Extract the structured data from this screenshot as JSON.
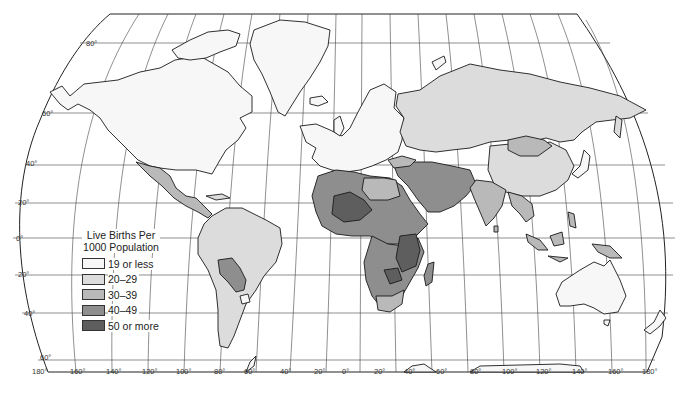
{
  "map": {
    "type": "choropleth",
    "projection": "Robinson-style world map",
    "legend": {
      "title_line1": "Live Births Per",
      "title_line2": "1000 Population",
      "classes": [
        {
          "label": "19 or less",
          "color": "#f7f7f7"
        },
        {
          "label": "20–29",
          "color": "#dcdcdc"
        },
        {
          "label": "30–39",
          "color": "#b9b9b9"
        },
        {
          "label": "40–49",
          "color": "#8e8e8e"
        },
        {
          "label": "50 or more",
          "color": "#5e5e5e"
        }
      ]
    },
    "latitude_labels": [
      "80°",
      "60°",
      "40°",
      "20°",
      "0°",
      "20°",
      "40°",
      "60°"
    ],
    "longitude_labels": [
      "180°",
      "160°",
      "140°",
      "120°",
      "100°",
      "80°",
      "60°",
      "40°",
      "20°",
      "0°",
      "20°",
      "40°",
      "60°",
      "80°",
      "100°",
      "120°",
      "140°",
      "160°",
      "180°"
    ],
    "regions": [
      {
        "name": "North America (USA/Canada)",
        "class": "19 or less"
      },
      {
        "name": "Greenland",
        "class": "19 or less"
      },
      {
        "name": "Mexico & Central America",
        "class": "30–39"
      },
      {
        "name": "South America (Brazil, Argentina etc.)",
        "class": "20–29"
      },
      {
        "name": "Bolivia / Paraguay",
        "class": "30–39"
      },
      {
        "name": "Uruguay",
        "class": "19 or less"
      },
      {
        "name": "Europe",
        "class": "19 or less"
      },
      {
        "name": "USSR",
        "class": "20–29"
      },
      {
        "name": "China",
        "class": "20–29"
      },
      {
        "name": "Mongolia",
        "class": "30–39"
      },
      {
        "name": "North Africa",
        "class": "40–49"
      },
      {
        "name": "Sahel / West Africa",
        "class": "50 or more"
      },
      {
        "name": "Central & East Africa",
        "class": "40–49"
      },
      {
        "name": "East Africa (Kenya/Tanzania)",
        "class": "50 or more"
      },
      {
        "name": "South Africa",
        "class": "30–39"
      },
      {
        "name": "Middle East",
        "class": "40–49"
      },
      {
        "name": "India / South Asia",
        "class": "30–39"
      },
      {
        "name": "Southeast Asia",
        "class": "30–39"
      },
      {
        "name": "Indonesia / New Guinea",
        "class": "30–39"
      },
      {
        "name": "Australia",
        "class": "19 or less"
      },
      {
        "name": "New Zealand",
        "class": "19 or less"
      },
      {
        "name": "Japan",
        "class": "19 or less"
      }
    ]
  }
}
